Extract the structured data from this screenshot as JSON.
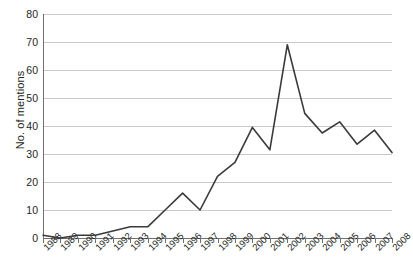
{
  "chart_data": {
    "type": "line",
    "title": "",
    "xlabel": "",
    "ylabel": "No. of mentions",
    "categories": [
      "1988",
      "1989",
      "1990",
      "1991",
      "1992",
      "1993",
      "1994",
      "1995",
      "1996",
      "1997",
      "1998",
      "1999",
      "2000",
      "2001",
      "2002",
      "2003",
      "2004",
      "2005",
      "2006",
      "2007",
      "2008"
    ],
    "values": [
      1,
      0,
      1,
      1,
      2.5,
      4,
      4,
      10,
      16,
      10,
      22,
      27,
      39.5,
      31.5,
      69,
      44.5,
      37.5,
      41.5,
      33.5,
      38.5,
      30.5
    ],
    "series": [
      {
        "name": "No. of mentions",
        "values": [
          1,
          0,
          1,
          1,
          2.5,
          4,
          4,
          10,
          16,
          10,
          22,
          27,
          39.5,
          31.5,
          69,
          44.5,
          37.5,
          41.5,
          33.5,
          38.5,
          30.5
        ]
      }
    ],
    "ylim": [
      0,
      80
    ],
    "ytick_values": [
      0,
      10,
      20,
      30,
      40,
      50,
      60,
      70,
      80
    ],
    "ytick_labels": [
      "0",
      "10",
      "20",
      "30",
      "40",
      "50",
      "60",
      "70",
      "80"
    ],
    "grid": "horizontal",
    "legend": "none",
    "line_color": "#3a3a3c",
    "grid_color": "#c8c9ca",
    "axis_color": "#6f7072",
    "background_color": "#ffffff"
  }
}
